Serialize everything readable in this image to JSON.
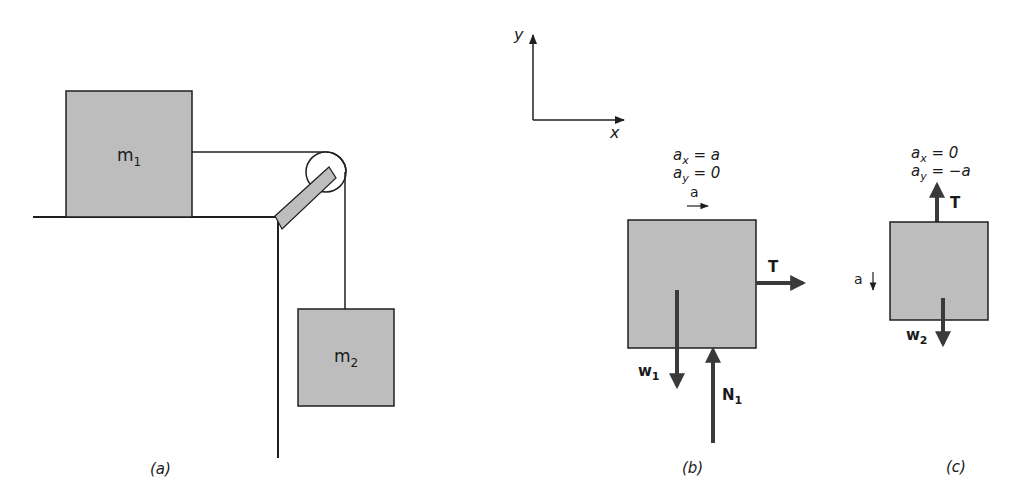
{
  "colors": {
    "block_fill": "#bdbdbd",
    "stroke": "#1f1f1f",
    "arrow": "#3a3a3a",
    "background": "#ffffff"
  },
  "panel_a": {
    "caption": "(a)",
    "block1": {
      "label": "m",
      "sub": "1"
    },
    "block2": {
      "label": "m",
      "sub": "2"
    }
  },
  "axes": {
    "x_label": "x",
    "y_label": "y"
  },
  "panel_b": {
    "caption": "(b)",
    "ax": {
      "sym": "a",
      "sub": "x",
      "rhs": " = a"
    },
    "ay": {
      "sym": "a",
      "sub": "y",
      "rhs": " = 0"
    },
    "accel_label": "a",
    "tension": "T",
    "weight": {
      "label": "w",
      "sub": "1"
    },
    "normal": {
      "label": "N",
      "sub": "1"
    }
  },
  "panel_c": {
    "caption": "(c)",
    "ax": {
      "sym": "a",
      "sub": "x",
      "rhs": " = 0"
    },
    "ay": {
      "sym": "a",
      "sub": "y",
      "rhs": " = −a"
    },
    "accel_label": "a",
    "tension": "T",
    "weight": {
      "label": "w",
      "sub": "2"
    }
  }
}
